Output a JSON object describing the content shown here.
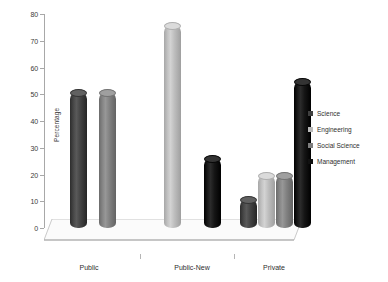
{
  "chart_data": {
    "type": "bar",
    "title": "",
    "xlabel": "",
    "ylabel": "Percentage",
    "ylim": [
      0,
      80
    ],
    "yticks": [
      0,
      10,
      20,
      30,
      40,
      50,
      60,
      70,
      80
    ],
    "categories": [
      "Public",
      "Public-New",
      "Private"
    ],
    "grid": false,
    "legend_position": "right",
    "style": "3d-cylinder-grayscale",
    "series": [
      {
        "name": "Science",
        "color": "#3f3f3f",
        "values": [
          51,
          null,
          11
        ]
      },
      {
        "name": "Engineering",
        "color": "#b9b9b9",
        "values": [
          null,
          76,
          20
        ]
      },
      {
        "name": "Social Science",
        "color": "#7d7d7d",
        "values": [
          51,
          null,
          20
        ]
      },
      {
        "name": "Management",
        "color": "#111111",
        "values": [
          null,
          26,
          55
        ]
      }
    ],
    "bars": [
      {
        "group": "Public",
        "series": "Science",
        "value": 51,
        "color": "#3f3f3f"
      },
      {
        "group": "Public",
        "series": "Social Science",
        "value": 51,
        "color": "#7d7d7d"
      },
      {
        "group": "Public-New",
        "series": "Engineering",
        "value": 76,
        "color": "#b9b9b9"
      },
      {
        "group": "Public-New",
        "series": "Management",
        "value": 26,
        "color": "#111111"
      },
      {
        "group": "Private",
        "series": "Science",
        "value": 11,
        "color": "#3f3f3f"
      },
      {
        "group": "Private",
        "series": "Engineering",
        "value": 20,
        "color": "#b9b9b9"
      },
      {
        "group": "Private",
        "series": "Social Science",
        "value": 20,
        "color": "#7d7d7d"
      },
      {
        "group": "Private",
        "series": "Management",
        "value": 55,
        "color": "#111111"
      }
    ]
  },
  "axis": {
    "y_title": "Percentage",
    "y_tick_labels": [
      "0",
      "10",
      "20",
      "30",
      "40",
      "50",
      "60",
      "70",
      "80"
    ],
    "x_tick_labels": [
      "Public",
      "Public-New",
      "Private"
    ]
  },
  "legend": {
    "items": [
      {
        "label": "Science",
        "color": "#3f3f3f"
      },
      {
        "label": "Engineering",
        "color": "#b9b9b9"
      },
      {
        "label": "Social Science",
        "color": "#7d7d7d"
      },
      {
        "label": "Management",
        "color": "#111111"
      }
    ]
  }
}
